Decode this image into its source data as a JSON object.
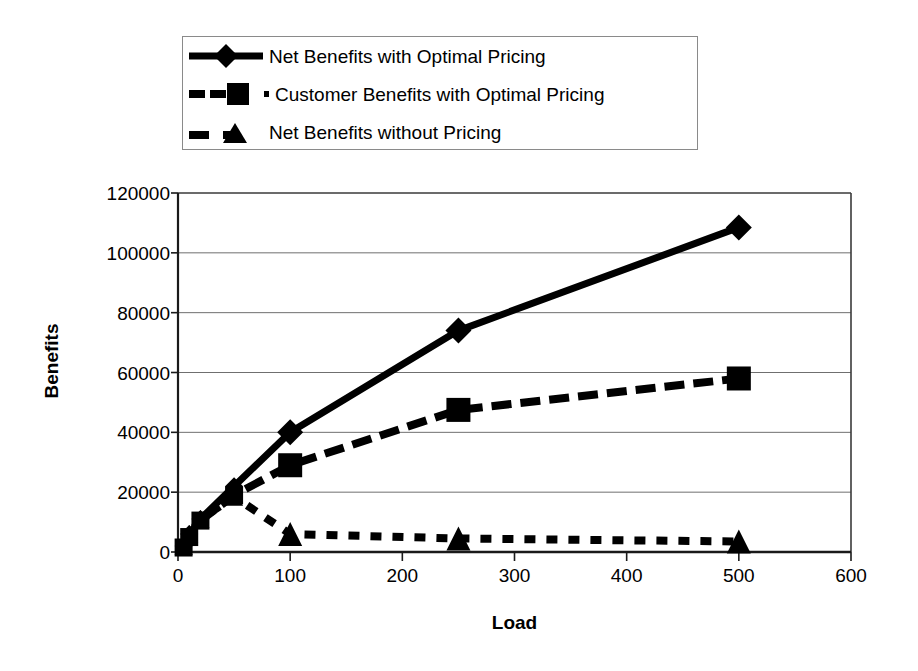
{
  "chart_data": {
    "type": "line",
    "title": "",
    "xlabel": "Load",
    "ylabel": "Benefits",
    "xlim": [
      0,
      600
    ],
    "ylim": [
      0,
      120000
    ],
    "xticks": [
      0,
      100,
      200,
      300,
      400,
      500,
      600
    ],
    "yticks": [
      0,
      20000,
      40000,
      60000,
      80000,
      100000,
      120000
    ],
    "xtick_labels": [
      "0",
      "100",
      "200",
      "300",
      "400",
      "500",
      "600"
    ],
    "ytick_labels": [
      "0",
      "20000",
      "40000",
      "60000",
      "80000",
      "100000",
      "120000"
    ],
    "grid": "horizontal",
    "legend_position": "above-plot",
    "x": [
      5,
      10,
      20,
      50,
      100,
      250,
      500
    ],
    "series": [
      {
        "name": "Net Benefits with Optimal Pricing",
        "marker": "diamond",
        "line_style": "solid",
        "color": "#000000",
        "values": [
          2000,
          6000,
          11000,
          22000,
          40000,
          74000,
          108500
        ]
      },
      {
        "name": "Customer Benefits with Optimal Pricing",
        "marker": "square",
        "line_style": "dashed",
        "color": "#000000",
        "values": [
          1500,
          5000,
          10500,
          19000,
          29000,
          47500,
          58000
        ]
      },
      {
        "name": "Net Benefits without Pricing",
        "marker": "triangle",
        "line_style": "dotted",
        "color": "#000000",
        "values": [
          2000,
          6000,
          11000,
          18500,
          6000,
          4500,
          3500
        ]
      }
    ]
  },
  "legend": {
    "entries": [
      {
        "label": "Net Benefits with Optimal Pricing",
        "marker": "diamond",
        "line_style": "solid"
      },
      {
        "label": "Customer Benefits with Optimal Pricing",
        "marker": "square",
        "line_style": "dashed"
      },
      {
        "label": "Net Benefits without Pricing",
        "marker": "triangle",
        "line_style": "dotted"
      }
    ]
  },
  "axes": {
    "y_title": "Benefits",
    "x_title": "Load"
  }
}
